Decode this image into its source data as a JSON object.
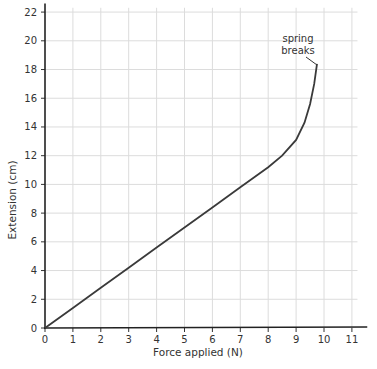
{
  "chart_data": {
    "type": "line",
    "title": "",
    "xlabel": "Force applied (N)",
    "ylabel": "Extension (cm)",
    "xlim": [
      0,
      11.5
    ],
    "ylim": [
      0,
      22.5
    ],
    "x_ticks": [
      0,
      1,
      2,
      3,
      4,
      5,
      6,
      7,
      8,
      9,
      10,
      11
    ],
    "y_ticks": [
      0,
      2,
      4,
      6,
      8,
      10,
      12,
      14,
      16,
      18,
      20,
      22
    ],
    "grid": true,
    "legend": null,
    "series": [
      {
        "name": "spring extension",
        "x": [
          0,
          1,
          2,
          3,
          4,
          5,
          6,
          7,
          8,
          8.5,
          9,
          9.3,
          9.5,
          9.65,
          9.75
        ],
        "y": [
          0,
          1.4,
          2.8,
          4.2,
          5.6,
          7.0,
          8.4,
          9.8,
          11.2,
          12.0,
          13.1,
          14.3,
          15.6,
          17.0,
          18.4
        ]
      }
    ],
    "annotations": [
      {
        "text_line1": "spring",
        "text_line2": "breaks",
        "x": 9.75,
        "y": 18.4
      }
    ]
  }
}
